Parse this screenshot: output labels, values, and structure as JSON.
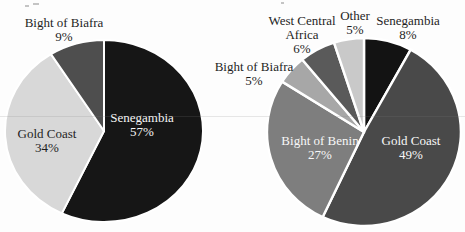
{
  "figure": {
    "description_labels_only": "two grayscale pie charts",
    "background": "#fdfdfd"
  },
  "chart_data": [
    {
      "type": "pie",
      "id": "left-pie",
      "title": "",
      "direction": "clockwise",
      "start_angle_deg": 0,
      "legend": "none",
      "stroke_color": "#ffffff",
      "stroke_width": 2,
      "slices": [
        {
          "label": "Senegambia",
          "value_pct": 57,
          "pct_label": "57%",
          "color": "#161616",
          "label_placement": "inside",
          "label_color": "#f7f7f7"
        },
        {
          "label": "Gold Coast",
          "value_pct": 34,
          "pct_label": "34%",
          "color": "#d8d8d8",
          "label_placement": "inside",
          "label_color": "#1f1f1f"
        },
        {
          "label": "Bight of Biafra",
          "value_pct": 9,
          "pct_label": "9%",
          "color": "#4e4e4e",
          "label_placement": "outside",
          "label_color": "#1f1f1f"
        }
      ]
    },
    {
      "type": "pie",
      "id": "right-pie",
      "title": "",
      "direction": "clockwise",
      "start_angle_deg": 0,
      "legend": "none",
      "stroke_color": "#ffffff",
      "stroke_width": 2.4,
      "slices": [
        {
          "label": "Senegambia",
          "value_pct": 8,
          "pct_label": "8%",
          "color": "#131313",
          "label_placement": "outside",
          "label_color": "#1f1f1f"
        },
        {
          "label": "Gold Coast",
          "value_pct": 49,
          "pct_label": "49%",
          "color": "#494949",
          "label_placement": "inside",
          "label_color": "#f5f5f5"
        },
        {
          "label": "Bight of Benin",
          "value_pct": 27,
          "pct_label": "27%",
          "color": "#7e7e7e",
          "label_placement": "inside",
          "label_color": "#f7f7f7"
        },
        {
          "label": "Bight of Biafra",
          "value_pct": 5,
          "pct_label": "5%",
          "color": "#a7a7a7",
          "label_placement": "outside",
          "label_color": "#1f1f1f"
        },
        {
          "label": "West Central Africa",
          "value_pct": 6,
          "pct_label": "6%",
          "color": "#5a5a5a",
          "label_placement": "outside",
          "label_color": "#1f1f1f"
        },
        {
          "label": "Other",
          "value_pct": 5,
          "pct_label": "5%",
          "color": "#c9c9c9",
          "label_placement": "outside",
          "label_color": "#1f1f1f"
        }
      ]
    }
  ]
}
